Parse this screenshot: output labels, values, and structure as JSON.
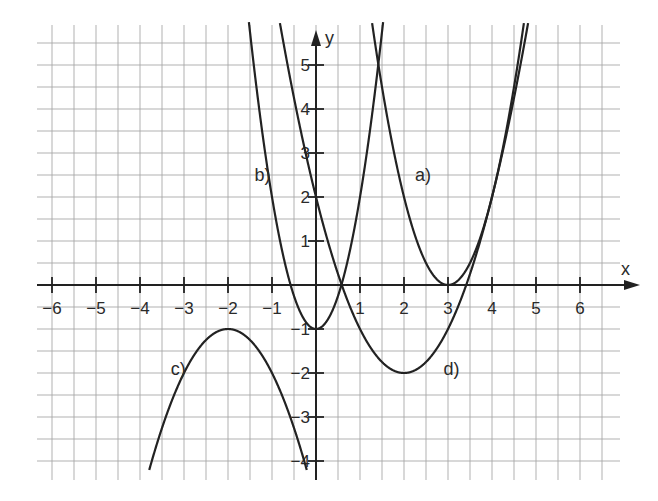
{
  "chart_data": {
    "type": "line",
    "title": "",
    "xlabel": "x",
    "ylabel": "y",
    "xlim": [
      -6.5,
      7
    ],
    "ylim": [
      -4.3,
      5.8
    ],
    "grid": true,
    "grid_step": 0.5,
    "x_ticks": [
      -6,
      -5,
      -4,
      -3,
      -2,
      -1,
      1,
      2,
      3,
      4,
      5,
      6
    ],
    "x_tick_labels": [
      "−6",
      "−5",
      "−4",
      "−3",
      "−2",
      "−1",
      "1",
      "2",
      "3",
      "4",
      "5",
      "6"
    ],
    "y_ticks": [
      -4,
      -3,
      -2,
      -1,
      1,
      2,
      3,
      4,
      5
    ],
    "y_tick_labels": [
      "−4",
      "−3",
      "−2",
      "−1",
      "1",
      "2",
      "3",
      "4",
      "5"
    ],
    "series": [
      {
        "name": "a)",
        "formula": "y = 2(x-3)^2",
        "vertex": [
          3,
          0
        ],
        "label_pos": [
          2.25,
          2.5
        ]
      },
      {
        "name": "b)",
        "formula": "y = 3x^2 - 1",
        "vertex": [
          0,
          -1
        ],
        "label_pos": [
          -1.4,
          2.5
        ]
      },
      {
        "name": "c)",
        "formula": "y = -(x+2)^2 - 1",
        "vertex": [
          -2,
          -1
        ],
        "label_pos": [
          -3.3,
          -1.9
        ]
      },
      {
        "name": "d)",
        "formula": "y = (x-2)^2 - 2",
        "vertex": [
          2,
          -2
        ],
        "label_pos": [
          2.9,
          -1.9
        ]
      }
    ],
    "curve_params": [
      {
        "a": 2,
        "h": 3,
        "k": 0
      },
      {
        "a": 3,
        "h": 0,
        "k": -1
      },
      {
        "a": -1,
        "h": -2,
        "k": -1
      },
      {
        "a": 1,
        "h": 2,
        "k": -2
      }
    ],
    "layout": {
      "origin_px": [
        316,
        285
      ],
      "unit_px": 44,
      "grid_left_px": 37,
      "grid_right_px": 620,
      "grid_top_px": 25,
      "grid_bottom_px": 480
    },
    "colors": {
      "grid": "#a8a8a8",
      "axis": "#222222",
      "curve": "#222222"
    }
  }
}
